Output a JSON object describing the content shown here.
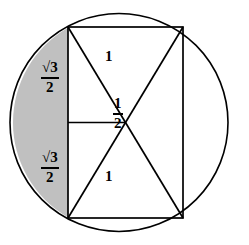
{
  "figure": {
    "colors": {
      "stroke": "#000000",
      "shaded_segment_fill": "#c0c0c0",
      "background": "#ffffff"
    },
    "circle": {
      "center_x": 119,
      "center_y": 122.5,
      "radius": 109
    },
    "rectangle": {
      "left": 68,
      "top": 27,
      "right": 183,
      "bottom": 218
    },
    "center_point": {
      "x": 125.5,
      "y": 122.5
    },
    "labels": {
      "left_upper": {
        "numerator": "√3",
        "denominator": "2"
      },
      "left_lower": {
        "numerator": "√3",
        "denominator": "2"
      },
      "half": {
        "numerator": "1",
        "denominator": "2"
      },
      "one_top": "1",
      "one_bottom": "1"
    }
  }
}
